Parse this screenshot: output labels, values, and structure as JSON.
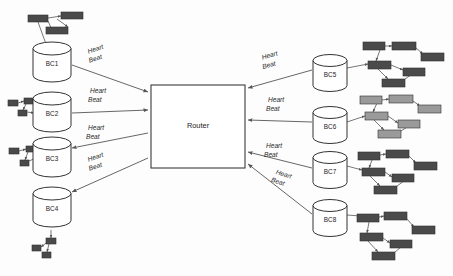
{
  "diagram": {
    "router": {
      "label": "Router",
      "x": 151,
      "y": 85,
      "w": 94,
      "h": 83,
      "fill": "#ffffff",
      "stroke": "#3b3b3b"
    },
    "colors": {
      "background": "#fdfdfd",
      "line": "#555555",
      "cylinder_stroke": "#333333",
      "cylinder_fill": "#ffffff",
      "node_dark": "#4a4a4a",
      "node_mid": "#5a5a5a",
      "node_light": "#9a9a9a",
      "node_stroke": "#2f2f2f",
      "text": "#1a1a1a"
    },
    "heartbeat_label": {
      "line1": "Heart",
      "line2": "Beat"
    },
    "cylinders": [
      {
        "id": "bc1",
        "label": "BC1",
        "cx": 52,
        "cy": 62,
        "rx": 19,
        "ry": 6.5,
        "h": 27,
        "side": "left"
      },
      {
        "id": "bc2",
        "label": "BC2",
        "cx": 52,
        "cy": 112,
        "rx": 19,
        "ry": 6.5,
        "h": 27,
        "side": "left"
      },
      {
        "id": "bc3",
        "label": "BC3",
        "cx": 52,
        "cy": 157,
        "rx": 19,
        "ry": 6.5,
        "h": 27,
        "side": "left"
      },
      {
        "id": "bc4",
        "label": "BC4",
        "cx": 52,
        "cy": 207,
        "rx": 19,
        "ry": 6.5,
        "h": 27,
        "side": "left"
      },
      {
        "id": "bc5",
        "label": "BC5",
        "cx": 330,
        "cy": 73,
        "rx": 17,
        "ry": 6.0,
        "h": 25,
        "side": "right"
      },
      {
        "id": "bc6",
        "label": "BC6",
        "cx": 330,
        "cy": 125,
        "rx": 17,
        "ry": 6.0,
        "h": 25,
        "side": "right"
      },
      {
        "id": "bc7",
        "label": "BC7",
        "cx": 330,
        "cy": 170,
        "rx": 17,
        "ry": 6.0,
        "h": 25,
        "side": "right"
      },
      {
        "id": "bc8",
        "label": "BC8",
        "cx": 330,
        "cy": 218,
        "rx": 17,
        "ry": 6.0,
        "h": 25,
        "side": "right"
      }
    ],
    "links": [
      {
        "id": "link-bc1",
        "from": "bc1",
        "to": "router",
        "x1": 72,
        "y1": 65,
        "x2": 148,
        "y2": 92,
        "arrow_at": "router",
        "label_x": 88,
        "label_y": 52,
        "rotate": -19
      },
      {
        "id": "link-bc2",
        "from": "bc2",
        "to": "router",
        "x1": 72,
        "y1": 113,
        "x2": 148,
        "y2": 110,
        "arrow_at": "router",
        "label_x": 90,
        "label_y": 91,
        "rotate": 0
      },
      {
        "id": "link-bc3",
        "from": "bc3",
        "to": "router",
        "x1": 72,
        "y1": 148,
        "x2": 148,
        "y2": 133,
        "arrow_at": "bc3",
        "label_x": 88,
        "label_y": 128,
        "rotate": 0
      },
      {
        "id": "link-bc4",
        "from": "bc4",
        "to": "router",
        "x1": 72,
        "y1": 192,
        "x2": 148,
        "y2": 158,
        "arrow_at": "bc4",
        "label_x": 88,
        "label_y": 160,
        "rotate": -19
      },
      {
        "id": "link-bc5",
        "from": "router",
        "to": "bc5",
        "x1": 248,
        "y1": 88,
        "x2": 312,
        "y2": 70,
        "arrow_at": "router",
        "label_x": 262,
        "label_y": 58,
        "rotate": -16
      },
      {
        "id": "link-bc6",
        "from": "router",
        "to": "bc6",
        "x1": 248,
        "y1": 120,
        "x2": 312,
        "y2": 122,
        "arrow_at": "router",
        "label_x": 268,
        "label_y": 100,
        "rotate": 0
      },
      {
        "id": "link-bc7",
        "from": "router",
        "to": "bc7",
        "x1": 248,
        "y1": 152,
        "x2": 312,
        "y2": 168,
        "arrow_at": "router",
        "label_x": 266,
        "label_y": 146,
        "rotate": 0
      },
      {
        "id": "link-bc8",
        "from": "router",
        "to": "bc8",
        "x1": 248,
        "y1": 164,
        "x2": 312,
        "y2": 214,
        "arrow_at": "router",
        "label_x": 276,
        "label_y": 172,
        "rotate": 18
      }
    ],
    "clusters": [
      {
        "id": "cluster-bc1",
        "attached_to": "bc1",
        "tone": "node_dark",
        "nodes": [
          {
            "x": 28,
            "y": 15,
            "w": 20,
            "h": 7
          },
          {
            "x": 61,
            "y": 12,
            "w": 22,
            "h": 7
          },
          {
            "x": 46,
            "y": 27,
            "w": 22,
            "h": 7
          }
        ],
        "edges": [
          {
            "x1": 48,
            "y1": 18,
            "x2": 61,
            "y2": 16
          },
          {
            "x1": 57,
            "y1": 19,
            "x2": 68,
            "y2": 27
          },
          {
            "x1": 48,
            "y1": 21,
            "x2": 52,
            "y2": 30
          },
          {
            "x1": 38,
            "y1": 22,
            "x2": 50,
            "y2": 55
          }
        ]
      },
      {
        "id": "cluster-bc2",
        "attached_to": "bc2",
        "tone": "node_dark",
        "nodes": [
          {
            "x": 8,
            "y": 100,
            "w": 10,
            "h": 6
          },
          {
            "x": 24,
            "y": 98,
            "w": 9,
            "h": 6
          },
          {
            "x": 18,
            "y": 110,
            "w": 9,
            "h": 6
          }
        ],
        "edges": [
          {
            "x1": 18,
            "y1": 103,
            "x2": 24,
            "y2": 101
          },
          {
            "x1": 26,
            "y1": 104,
            "x2": 23,
            "y2": 110
          },
          {
            "x1": 27,
            "y1": 112,
            "x2": 34,
            "y2": 113
          }
        ]
      },
      {
        "id": "cluster-bc3",
        "attached_to": "bc3",
        "tone": "node_dark",
        "nodes": [
          {
            "x": 9,
            "y": 148,
            "w": 10,
            "h": 6
          },
          {
            "x": 26,
            "y": 146,
            "w": 9,
            "h": 6
          },
          {
            "x": 20,
            "y": 160,
            "w": 9,
            "h": 6
          }
        ],
        "edges": [
          {
            "x1": 19,
            "y1": 151,
            "x2": 26,
            "y2": 149
          },
          {
            "x1": 28,
            "y1": 152,
            "x2": 25,
            "y2": 160
          },
          {
            "x1": 29,
            "y1": 161,
            "x2": 36,
            "y2": 158
          }
        ]
      },
      {
        "id": "cluster-bc4",
        "attached_to": "bc4",
        "tone": "node_dark",
        "nodes": [
          {
            "x": 46,
            "y": 238,
            "w": 10,
            "h": 6
          },
          {
            "x": 32,
            "y": 245,
            "w": 9,
            "h": 6
          },
          {
            "x": 42,
            "y": 252,
            "w": 9,
            "h": 6
          }
        ],
        "edges": [
          {
            "x1": 51,
            "y1": 230,
            "x2": 51,
            "y2": 238
          },
          {
            "x1": 46,
            "y1": 243,
            "x2": 41,
            "y2": 247
          },
          {
            "x1": 49,
            "y1": 244,
            "x2": 47,
            "y2": 252
          }
        ]
      },
      {
        "id": "cluster-bc5",
        "attached_to": "bc5",
        "tone": "node_dark",
        "nodes": [
          {
            "x": 363,
            "y": 42,
            "w": 22,
            "h": 8
          },
          {
            "x": 392,
            "y": 42,
            "w": 24,
            "h": 8
          },
          {
            "x": 421,
            "y": 53,
            "w": 23,
            "h": 8
          },
          {
            "x": 368,
            "y": 61,
            "w": 23,
            "h": 8
          },
          {
            "x": 403,
            "y": 68,
            "w": 22,
            "h": 8
          },
          {
            "x": 382,
            "y": 79,
            "w": 23,
            "h": 8
          }
        ],
        "edges": [
          {
            "x1": 385,
            "y1": 46,
            "x2": 392,
            "y2": 46
          },
          {
            "x1": 416,
            "y1": 48,
            "x2": 423,
            "y2": 54
          },
          {
            "x1": 380,
            "y1": 50,
            "x2": 376,
            "y2": 61
          },
          {
            "x1": 391,
            "y1": 65,
            "x2": 403,
            "y2": 70
          },
          {
            "x1": 378,
            "y1": 69,
            "x2": 388,
            "y2": 79
          },
          {
            "x1": 405,
            "y1": 79,
            "x2": 415,
            "y2": 72
          },
          {
            "x1": 347,
            "y1": 68,
            "x2": 368,
            "y2": 64
          }
        ]
      },
      {
        "id": "cluster-bc6",
        "attached_to": "bc6",
        "tone": "node_light",
        "nodes": [
          {
            "x": 360,
            "y": 96,
            "w": 22,
            "h": 8
          },
          {
            "x": 389,
            "y": 95,
            "w": 24,
            "h": 8
          },
          {
            "x": 418,
            "y": 105,
            "w": 23,
            "h": 8
          },
          {
            "x": 365,
            "y": 112,
            "w": 23,
            "h": 8
          },
          {
            "x": 398,
            "y": 120,
            "w": 22,
            "h": 8
          },
          {
            "x": 378,
            "y": 130,
            "w": 23,
            "h": 8
          }
        ],
        "edges": [
          {
            "x1": 382,
            "y1": 100,
            "x2": 389,
            "y2": 99
          },
          {
            "x1": 413,
            "y1": 101,
            "x2": 420,
            "y2": 106
          },
          {
            "x1": 377,
            "y1": 103,
            "x2": 373,
            "y2": 112
          },
          {
            "x1": 388,
            "y1": 116,
            "x2": 398,
            "y2": 123
          },
          {
            "x1": 374,
            "y1": 120,
            "x2": 384,
            "y2": 130
          },
          {
            "x1": 401,
            "y1": 131,
            "x2": 412,
            "y2": 124
          },
          {
            "x1": 347,
            "y1": 122,
            "x2": 365,
            "y2": 116
          }
        ]
      },
      {
        "id": "cluster-bc7",
        "attached_to": "bc7",
        "tone": "node_dark",
        "nodes": [
          {
            "x": 358,
            "y": 152,
            "w": 22,
            "h": 8
          },
          {
            "x": 386,
            "y": 150,
            "w": 23,
            "h": 8
          },
          {
            "x": 414,
            "y": 162,
            "w": 23,
            "h": 8
          },
          {
            "x": 362,
            "y": 168,
            "w": 23,
            "h": 8
          },
          {
            "x": 392,
            "y": 174,
            "w": 22,
            "h": 8
          },
          {
            "x": 374,
            "y": 186,
            "w": 23,
            "h": 8
          }
        ],
        "edges": [
          {
            "x1": 380,
            "y1": 155,
            "x2": 386,
            "y2": 154
          },
          {
            "x1": 409,
            "y1": 156,
            "x2": 416,
            "y2": 163
          },
          {
            "x1": 372,
            "y1": 160,
            "x2": 369,
            "y2": 168
          },
          {
            "x1": 385,
            "y1": 172,
            "x2": 392,
            "y2": 177
          },
          {
            "x1": 370,
            "y1": 176,
            "x2": 380,
            "y2": 186
          },
          {
            "x1": 397,
            "y1": 186,
            "x2": 408,
            "y2": 178
          },
          {
            "x1": 347,
            "y1": 166,
            "x2": 362,
            "y2": 170
          }
        ]
      },
      {
        "id": "cluster-bc8",
        "attached_to": "bc8",
        "tone": "node_dark",
        "nodes": [
          {
            "x": 357,
            "y": 214,
            "w": 22,
            "h": 8
          },
          {
            "x": 384,
            "y": 212,
            "w": 23,
            "h": 8
          },
          {
            "x": 412,
            "y": 226,
            "w": 23,
            "h": 8
          },
          {
            "x": 360,
            "y": 233,
            "w": 23,
            "h": 8
          },
          {
            "x": 390,
            "y": 240,
            "w": 22,
            "h": 8
          },
          {
            "x": 372,
            "y": 252,
            "w": 23,
            "h": 8
          }
        ],
        "edges": [
          {
            "x1": 379,
            "y1": 217,
            "x2": 384,
            "y2": 216
          },
          {
            "x1": 407,
            "y1": 219,
            "x2": 414,
            "y2": 227
          },
          {
            "x1": 369,
            "y1": 222,
            "x2": 367,
            "y2": 233
          },
          {
            "x1": 383,
            "y1": 238,
            "x2": 390,
            "y2": 243
          },
          {
            "x1": 368,
            "y1": 241,
            "x2": 378,
            "y2": 252
          },
          {
            "x1": 395,
            "y1": 252,
            "x2": 406,
            "y2": 243
          },
          {
            "x1": 347,
            "y1": 215,
            "x2": 360,
            "y2": 216
          }
        ]
      }
    ]
  }
}
